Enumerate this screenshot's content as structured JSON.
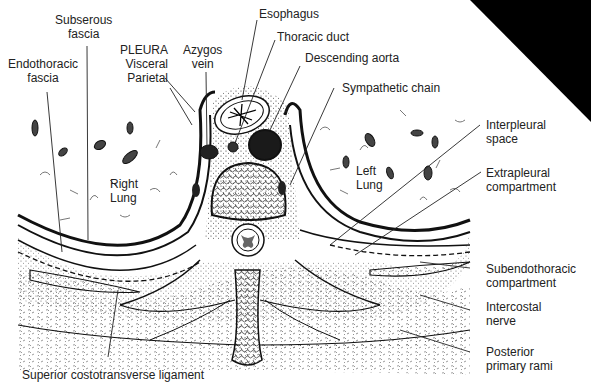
{
  "figure": {
    "type": "anatomical cross-section",
    "corner_color": "#000000"
  },
  "labels": {
    "subserous": {
      "l1": "Subserous",
      "l2": "fascia"
    },
    "endothoracic": {
      "l1": "Endothoracic",
      "l2": "fascia"
    },
    "pleura": {
      "l1": "PLEURA",
      "l2": "Visceral",
      "l3": "Parietal"
    },
    "azygos": {
      "l1": "Azygos",
      "l2": "vein"
    },
    "esophagus": "Esophagus",
    "thoracic_duct": "Thoracic duct",
    "descending_aorta": "Descending aorta",
    "sympathetic_chain": "Sympathetic chain",
    "interpleural": {
      "l1": "Interpleural",
      "l2": "space"
    },
    "extrapleural": {
      "l1": "Extrapleural",
      "l2": "compartment"
    },
    "subendothoracic": {
      "l1": "Subendothoracic",
      "l2": "compartment"
    },
    "intercostal": {
      "l1": "Intercostal",
      "l2": "nerve"
    },
    "posterior_rami": {
      "l1": "Posterior",
      "l2": "primary rami"
    },
    "superior_ligament": "Superior costotransverse ligament",
    "right_lung": {
      "l1": "Right",
      "l2": "Lung"
    },
    "left_lung": {
      "l1": "Left",
      "l2": "Lung"
    }
  }
}
